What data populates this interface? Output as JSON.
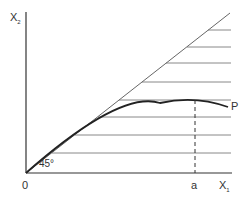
{
  "diagram": {
    "y_axis_label": "X",
    "y_axis_sub": "2",
    "x_axis_label": "X",
    "x_axis_sub": "1",
    "origin_label": "0",
    "angle_label": "45°",
    "curve_label": "P",
    "marker_label": "a",
    "colors": {
      "axis": "#333333",
      "line": "#666666",
      "curve": "#222222"
    }
  }
}
